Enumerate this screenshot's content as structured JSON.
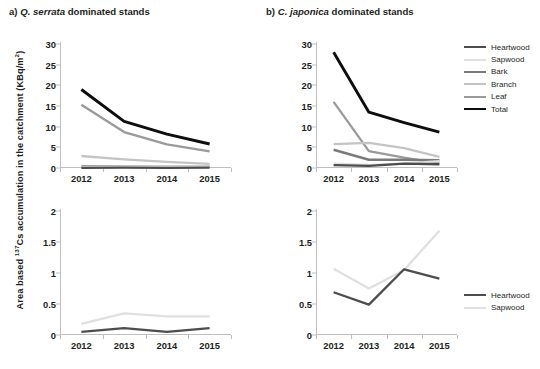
{
  "axis_title": {
    "pre": "Area based ",
    "isotope": "137",
    "post": "Cs accumulation in the catchment  (KBq/m",
    "unit_sup": "2",
    "tail": ")"
  },
  "panels": {
    "a": {
      "title_prefix": "a) ",
      "species": "Q. serrata",
      "title_suffix": " dominated stands"
    },
    "b": {
      "title_prefix": "b) ",
      "species": "C. japonica",
      "title_suffix": " dominated stands"
    }
  },
  "colors": {
    "heartwood": "#4d4d4d",
    "sapwood": "#e0e0e0",
    "bark": "#7a7a7a",
    "branch": "#c4c4c4",
    "leaf": "#9a9a9a",
    "total": "#0d0d0d",
    "axis": "#bfbfbf",
    "text": "#231f20"
  },
  "legend_top": {
    "items": [
      {
        "label": "Heartwood",
        "color": "#4d4d4d",
        "width": 2.2
      },
      {
        "label": "Sapwood",
        "color": "#e0e0e0",
        "width": 2.2
      },
      {
        "label": "Bark",
        "color": "#7a7a7a",
        "width": 2.4
      },
      {
        "label": "Branch",
        "color": "#c4c4c4",
        "width": 2.2
      },
      {
        "label": "Leaf",
        "color": "#9a9a9a",
        "width": 2.2
      },
      {
        "label": "Total",
        "color": "#0d0d0d",
        "width": 2.8
      }
    ]
  },
  "legend_bottom": {
    "items": [
      {
        "label": "Heartwood",
        "color": "#4d4d4d",
        "width": 2.4
      },
      {
        "label": "Sapwood",
        "color": "#e0e0e0",
        "width": 2.4
      }
    ]
  },
  "chart_data": [
    {
      "id": "a",
      "type": "line",
      "title": "a) Q. serrata dominated stands",
      "xlabel": "",
      "ylabel": "Area based 137Cs accumulation in the catchment (KBq/m2)",
      "categories": [
        "2012",
        "2013",
        "2014",
        "2015"
      ],
      "ylim": [
        0,
        30
      ],
      "yticks": [
        0,
        5,
        10,
        15,
        20,
        25,
        30
      ],
      "ytick_labels": [
        "0",
        "5",
        "10",
        "15",
        "20",
        "25",
        "30"
      ],
      "grid": false,
      "legend_position": "outside-right-top",
      "series": [
        {
          "name": "Total",
          "values": [
            19.0,
            11.3,
            8.2,
            5.8
          ]
        },
        {
          "name": "Leaf",
          "values": [
            15.3,
            8.7,
            5.7,
            4.0
          ]
        },
        {
          "name": "Branch",
          "values": [
            2.9,
            2.1,
            1.5,
            1.0
          ]
        },
        {
          "name": "Bark",
          "values": [
            0.35,
            0.35,
            0.3,
            0.3
          ]
        },
        {
          "name": "Sapwood",
          "values": [
            0.18,
            0.35,
            0.3,
            0.3
          ]
        },
        {
          "name": "Heartwood",
          "values": [
            0.05,
            0.11,
            0.05,
            0.11
          ]
        }
      ]
    },
    {
      "id": "b",
      "type": "line",
      "title": "b) C. japonica dominated stands",
      "xlabel": "",
      "ylabel": "Area based 137Cs accumulation in the catchment (KBq/m2)",
      "categories": [
        "2012",
        "2013",
        "2014",
        "2015"
      ],
      "ylim": [
        0,
        30
      ],
      "yticks": [
        0,
        5,
        10,
        15,
        20,
        25,
        30
      ],
      "ytick_labels": [
        "0",
        "5",
        "10",
        "15",
        "20",
        "25",
        "30"
      ],
      "grid": false,
      "legend_position": "outside-right-top",
      "series": [
        {
          "name": "Total",
          "values": [
            28.0,
            13.5,
            11.0,
            8.7
          ]
        },
        {
          "name": "Leaf",
          "values": [
            16.0,
            4.1,
            2.5,
            1.1
          ]
        },
        {
          "name": "Branch",
          "values": [
            5.8,
            6.1,
            4.8,
            2.7
          ]
        },
        {
          "name": "Bark",
          "values": [
            4.4,
            2.0,
            2.0,
            1.9
          ]
        },
        {
          "name": "Sapwood",
          "values": [
            1.07,
            0.75,
            1.05,
            1.68
          ]
        },
        {
          "name": "Heartwood",
          "values": [
            0.69,
            0.49,
            1.06,
            0.91
          ]
        }
      ]
    },
    {
      "id": "c",
      "type": "line",
      "title": "",
      "xlabel": "",
      "ylabel": "Area based 137Cs accumulation in the catchment (KBq/m2)",
      "categories": [
        "2012",
        "2013",
        "2014",
        "2015"
      ],
      "ylim": [
        0,
        2
      ],
      "yticks": [
        0,
        0.5,
        1,
        1.5,
        2
      ],
      "ytick_labels": [
        "0",
        "0.5",
        "1",
        "1.5",
        "2"
      ],
      "grid": false,
      "legend_position": "none",
      "series": [
        {
          "name": "Sapwood",
          "values": [
            0.18,
            0.35,
            0.3,
            0.3
          ]
        },
        {
          "name": "Heartwood",
          "values": [
            0.05,
            0.11,
            0.05,
            0.11
          ]
        }
      ]
    },
    {
      "id": "d",
      "type": "line",
      "title": "",
      "xlabel": "",
      "ylabel": "Area based 137Cs accumulation in the catchment (KBq/m2)",
      "categories": [
        "2012",
        "2013",
        "2014",
        "2015"
      ],
      "ylim": [
        0,
        2
      ],
      "yticks": [
        0,
        0.5,
        1,
        1.5,
        2
      ],
      "ytick_labels": [
        "0",
        "0.5",
        "1",
        "1.5",
        "2"
      ],
      "grid": false,
      "legend_position": "outside-right-middle",
      "series": [
        {
          "name": "Sapwood",
          "values": [
            1.07,
            0.75,
            1.05,
            1.68
          ]
        },
        {
          "name": "Heartwood",
          "values": [
            0.69,
            0.49,
            1.06,
            0.91
          ]
        }
      ]
    }
  ]
}
